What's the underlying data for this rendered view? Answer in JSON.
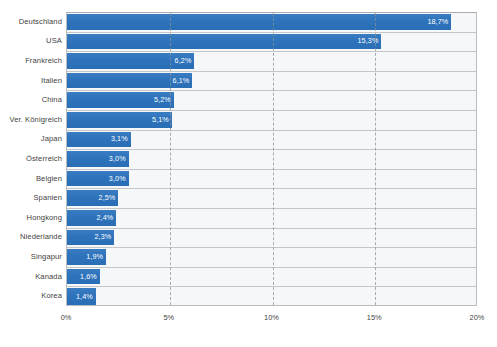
{
  "clipped_caption": "",
  "chart_data": {
    "type": "bar",
    "orientation": "horizontal",
    "title": "",
    "subtitle": "",
    "xlabel": "",
    "ylabel": "",
    "xlim": [
      0,
      20
    ],
    "grid": "vertical-dashed",
    "legend": "none",
    "bar_color": "#2e75bd",
    "plot_background": "#f6f7f8",
    "value_label_color": "#ffffff",
    "axis_tick_labels": [
      "0%",
      "5%",
      "10%",
      "15%",
      "20%"
    ],
    "axis_tick_values": [
      0,
      5,
      10,
      15,
      20
    ],
    "categories": [
      "Deutschland",
      "USA",
      "Frankreich",
      "Italien",
      "China",
      "Ver. Königreich",
      "Japan",
      "Österreich",
      "Belgien",
      "Spanien",
      "Hongkong",
      "Niederlande",
      "Singapur",
      "Kanada",
      "Korea"
    ],
    "values": [
      18.7,
      15.3,
      6.2,
      6.1,
      5.2,
      5.1,
      3.1,
      3.0,
      3.0,
      2.5,
      2.4,
      2.3,
      1.9,
      1.6,
      1.4
    ],
    "value_labels": [
      "18,7%",
      "15,3%",
      "6,2%",
      "6,1%",
      "5,2%",
      "5,1%",
      "3,1%",
      "3,0%",
      "3,0%",
      "2,5%",
      "2,4%",
      "2,3%",
      "1,9%",
      "1,6%",
      "1,4%"
    ]
  }
}
